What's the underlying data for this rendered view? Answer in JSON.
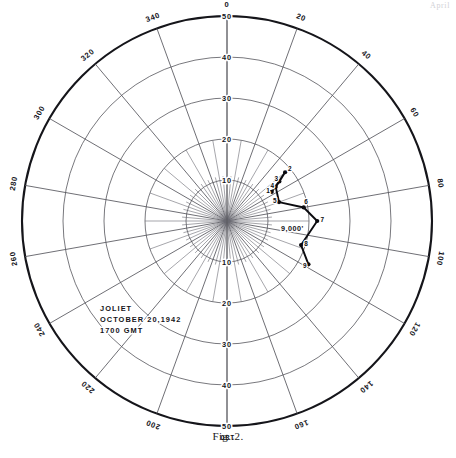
{
  "figure": {
    "caption_prefix": "F",
    "caption_rest": "IG",
    "caption_number": ". 2.",
    "caption_full": "Fig. 2.",
    "page_header": "April"
  },
  "annotation": {
    "station": "JOLIET",
    "date": "OCTOBER 20,1942",
    "time": "1700 GMT",
    "altitude_label": "9,000'"
  },
  "chart_data": {
    "type": "scatter",
    "title": "",
    "subtitle": "",
    "plot_kind": "polar-hodograph",
    "xlabel": "",
    "ylabel": "",
    "azimuth_unit": "degrees",
    "radial_unit": "knots",
    "radial_range": [
      0,
      50
    ],
    "radial_tick_step": 10,
    "radial_ticks_up": [
      "50",
      "40",
      "30",
      "20",
      "10"
    ],
    "radial_ticks_down": [
      "10",
      "20",
      "30",
      "40",
      "50"
    ],
    "radial_ticks_values": [
      10,
      20,
      30,
      40,
      50
    ],
    "azimuth_tick_step": 20,
    "azimuth_ticks": [
      "0",
      "20",
      "40",
      "60",
      "80",
      "100",
      "120",
      "140",
      "160",
      "180",
      "200",
      "220",
      "240",
      "260",
      "280",
      "300",
      "320",
      "340"
    ],
    "azimuth_minor_step": 10,
    "grid": true,
    "legend": false,
    "legend_position": "none",
    "series": [
      {
        "name": "wind-trace",
        "point_labels": [
          "1",
          "2",
          "3",
          "4",
          "5",
          "6",
          "7",
          "8",
          "9"
        ],
        "points": [
          {
            "label": "1",
            "azimuth": 57,
            "radial": 13.0
          },
          {
            "label": "2",
            "azimuth": 50,
            "radial": 18.5
          },
          {
            "label": "3",
            "azimuth": 53,
            "radial": 16.0
          },
          {
            "label": "4",
            "azimuth": 55,
            "radial": 14.5
          },
          {
            "label": "5",
            "azimuth": 70,
            "radial": 13.5
          },
          {
            "label": "6",
            "azimuth": 80,
            "radial": 19.0
          },
          {
            "label": "7",
            "azimuth": 90,
            "radial": 22.0
          },
          {
            "label": "8",
            "azimuth": 108,
            "radial": 19.0
          },
          {
            "label": "9",
            "azimuth": 118,
            "radial": 22.5
          }
        ]
      }
    ]
  }
}
